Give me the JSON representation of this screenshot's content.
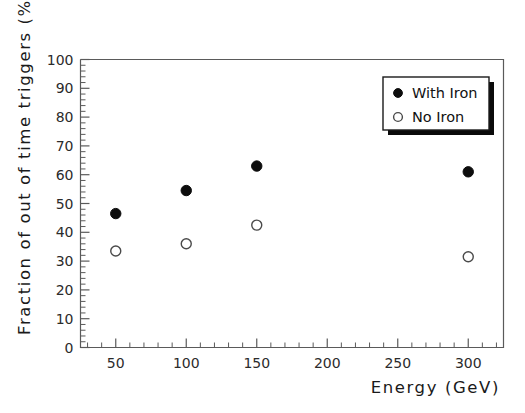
{
  "chart_data": {
    "type": "scatter",
    "title": "",
    "xlabel": "Energy  (GeV)",
    "ylabel": "Fraction of out of time triggers  (%)",
    "xlim": [
      25,
      325
    ],
    "ylim": [
      0,
      100
    ],
    "xticks": [
      50,
      100,
      150,
      200,
      250,
      300
    ],
    "yticks": [
      0,
      10,
      20,
      30,
      40,
      50,
      60,
      70,
      80,
      90,
      100
    ],
    "x_minor_step": 10,
    "y_minor_step": 2,
    "grid": false,
    "legend_position": "top-right",
    "x": [
      50,
      100,
      150,
      300
    ],
    "series": [
      {
        "name": "With Iron",
        "marker": "filled-circle",
        "values": [
          46.5,
          54.5,
          63,
          61
        ]
      },
      {
        "name": "No Iron",
        "marker": "open-circle",
        "values": [
          33.5,
          36,
          42.5,
          31.5
        ]
      }
    ]
  },
  "axes": {
    "x_tick_labels": [
      "50",
      "100",
      "150",
      "200",
      "250",
      "300"
    ],
    "y_tick_labels": [
      "0",
      "10",
      "20",
      "30",
      "40",
      "50",
      "60",
      "70",
      "80",
      "90",
      "100"
    ],
    "x_title": "Energy  (GeV)",
    "y_title": "Fraction of out of time triggers  (%)"
  },
  "legend": {
    "entries": [
      {
        "label": "With Iron",
        "marker": "filled-circle"
      },
      {
        "label": "No Iron",
        "marker": "open-circle"
      }
    ]
  },
  "colors": {
    "background": "#ffffff",
    "axis": "#5a5a5a",
    "filled_marker": "#0d0d0d",
    "open_marker_stroke": "#4a4a4a",
    "legend_border": "#1a1a1a",
    "legend_shadow": "#0a0a0a",
    "text": "#1a1a1a"
  }
}
